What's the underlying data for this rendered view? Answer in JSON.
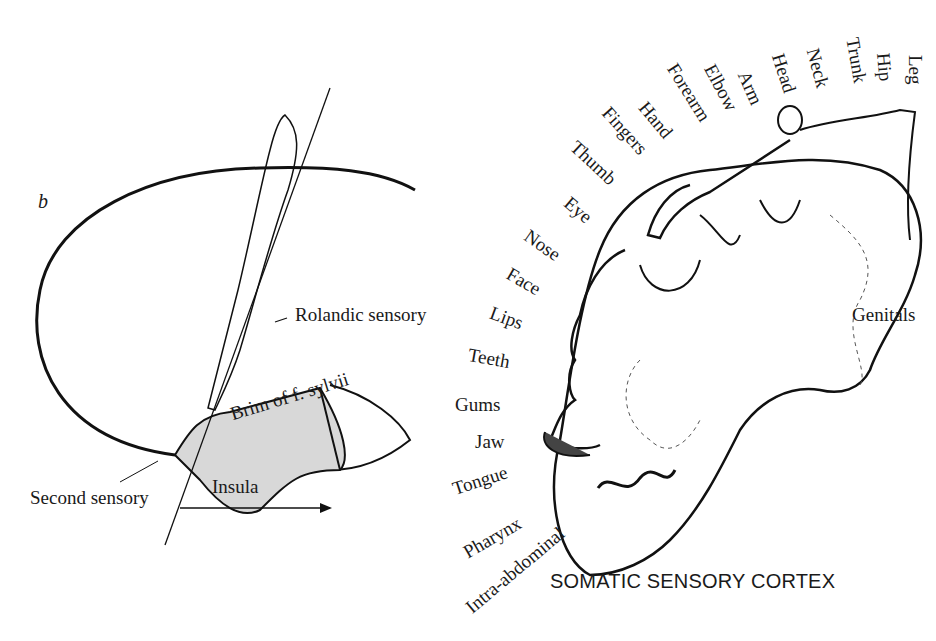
{
  "panel_b": {
    "letter": "b",
    "labels": {
      "rolandic": "Rolandic sensory",
      "brim": "Brim of f. sylvii",
      "second": "Second sensory",
      "insula": "Insula"
    }
  },
  "homunculus": {
    "title": "SOMATIC SENSORY CORTEX",
    "top_labels": [
      "Leg",
      "Hip",
      "Trunk",
      "Neck",
      "Head",
      "Arm",
      "Elbow",
      "Forearm",
      "Hand",
      "Fingers",
      "Thumb"
    ],
    "side_labels": [
      "Eye",
      "Nose",
      "Face",
      "Lips",
      "Teeth",
      "Gums",
      "Jaw",
      "Tongue",
      "Pharynx",
      "Intra-abdominal"
    ],
    "genitals": "Genitals"
  }
}
